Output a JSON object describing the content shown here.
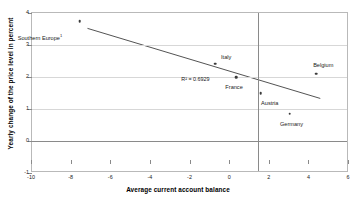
{
  "chart_data": {
    "type": "scatter",
    "title": "",
    "xlabel": "Average current account balance",
    "ylabel": "Yearly change of the price level in percent",
    "xlim": [
      -10,
      6
    ],
    "ylim": [
      -1,
      4
    ],
    "xticks": [
      "-10",
      "-8",
      "-6",
      "-4",
      "-2",
      "0",
      "2",
      "4",
      "6"
    ],
    "xtick_values": [
      -10,
      -8,
      -6,
      -4,
      -2,
      0,
      2,
      4,
      6
    ],
    "yticks": [
      "-1",
      "0",
      "1",
      "2",
      "3",
      "4"
    ],
    "ytick_values": [
      -1,
      0,
      1,
      2,
      3,
      4
    ],
    "grid": true,
    "legend": false,
    "points": [
      {
        "label": "Southern Europe",
        "footnote": "1",
        "x": -7.6,
        "y": 3.75,
        "label_dx": -2.0,
        "label_dy": -0.45
      },
      {
        "label": "Italy",
        "footnote": "",
        "x": -0.75,
        "y": 2.42,
        "label_dx": 0.55,
        "label_dy": 0.22
      },
      {
        "label": "France",
        "footnote": "",
        "x": 0.3,
        "y": 2.0,
        "label_dx": -0.1,
        "label_dy": -0.32
      },
      {
        "label": "Belgium",
        "footnote": "",
        "x": 4.35,
        "y": 2.1,
        "label_dx": 0.35,
        "label_dy": 0.28
      },
      {
        "label": "Austria",
        "footnote": "",
        "x": 1.55,
        "y": 1.5,
        "label_dx": 0.45,
        "label_dy": -0.3
      },
      {
        "label": "Germany",
        "footnote": "",
        "x": 3.0,
        "y": 0.85,
        "label_dx": 0.1,
        "label_dy": -0.32
      }
    ],
    "trendline": {
      "x0": -7.2,
      "y0": 3.52,
      "x1": 4.55,
      "y1": 1.33
    },
    "r2_label": "R² = 0.6929",
    "r2_x": -1.75,
    "r2_y": 1.95,
    "reference_lines": {
      "horizontal_zero": 0,
      "vertical": 1.42
    },
    "colors": {
      "point": "#3b3b3b",
      "trendline": "#404040",
      "gridline": "#d7d7d7",
      "axis": "#8a8a8a",
      "text": "#1a1a1a"
    }
  }
}
